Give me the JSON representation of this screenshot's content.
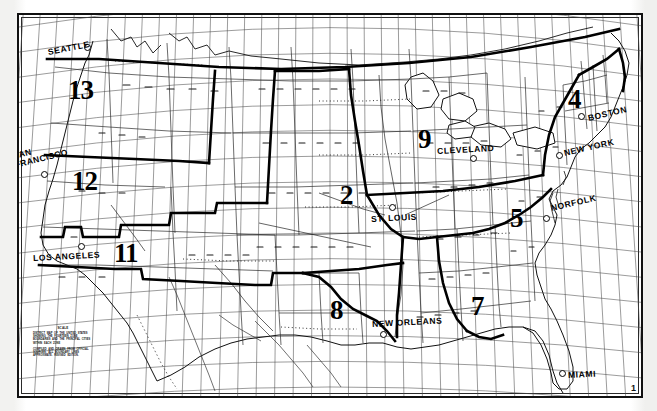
{
  "document": {
    "kind": "map",
    "title": "United States Zone Map",
    "frame_color": "#111111",
    "background_color": "#ffffff",
    "ink_color": "#000000"
  },
  "cities": [
    {
      "name": "SEATTLE",
      "x": 48,
      "y": 47,
      "dot_x": 84,
      "dot_y": 44,
      "two_line": false
    },
    {
      "name": "SAN\nFRANCISCO",
      "x": 14,
      "y": 152,
      "dot_x": 41,
      "dot_y": 171,
      "two_line": true
    },
    {
      "name": "LOS ANGELES",
      "x": 33,
      "y": 253,
      "dot_x": 78,
      "dot_y": 243,
      "two_line": false
    },
    {
      "name": "ST. LOUIS",
      "x": 371,
      "y": 214,
      "dot_x": 389,
      "dot_y": 204,
      "two_line": false
    },
    {
      "name": "CLEVELAND",
      "x": 437,
      "y": 146,
      "dot_x": 470,
      "dot_y": 155,
      "two_line": false
    },
    {
      "name": "BOSTON",
      "x": 588,
      "y": 113,
      "dot_x": 578,
      "dot_y": 113,
      "two_line": false
    },
    {
      "name": "NEW YORK",
      "x": 564,
      "y": 148,
      "dot_x": 556,
      "dot_y": 152,
      "two_line": false
    },
    {
      "name": "NORFOLK",
      "x": 551,
      "y": 203,
      "dot_x": 543,
      "dot_y": 215,
      "two_line": false
    },
    {
      "name": "NEW ORLEANS",
      "x": 372,
      "y": 319,
      "dot_x": 380,
      "dot_y": 331,
      "two_line": false
    },
    {
      "name": "MIAMI",
      "x": 568,
      "y": 370,
      "dot_x": 559,
      "dot_y": 370,
      "two_line": false
    }
  ],
  "zones": [
    {
      "label": "13",
      "x": 68,
      "y": 77
    },
    {
      "label": "12",
      "x": 72,
      "y": 168
    },
    {
      "label": "11",
      "x": 114,
      "y": 240
    },
    {
      "label": "2",
      "x": 340,
      "y": 182
    },
    {
      "label": "9",
      "x": 418,
      "y": 126
    },
    {
      "label": "4",
      "x": 568,
      "y": 86
    },
    {
      "label": "5",
      "x": 510,
      "y": 205
    },
    {
      "label": "7",
      "x": 471,
      "y": 293
    },
    {
      "label": "8",
      "x": 330,
      "y": 297
    }
  ],
  "legend": {
    "title": "SCALE",
    "blocks": [
      "DISTRICT MAP OF THE UNITED STATES SHOWING THE FOURTEEN ZONE BOUNDARIES AND THE PRINCIPAL CITIES WITHIN EACH ZONE",
      "COMPILED AND DRAWN FROM OFFICIAL SOURCES. ALL BOUNDARY LINES APPROXIMATE. REVISED EDITION."
    ]
  },
  "corner_mark": {
    "text": "1",
    "x": 631,
    "y": 383
  },
  "grid": {
    "meridian_count": 38,
    "parallel_count": 16,
    "line_color": "#3a3a3a"
  }
}
